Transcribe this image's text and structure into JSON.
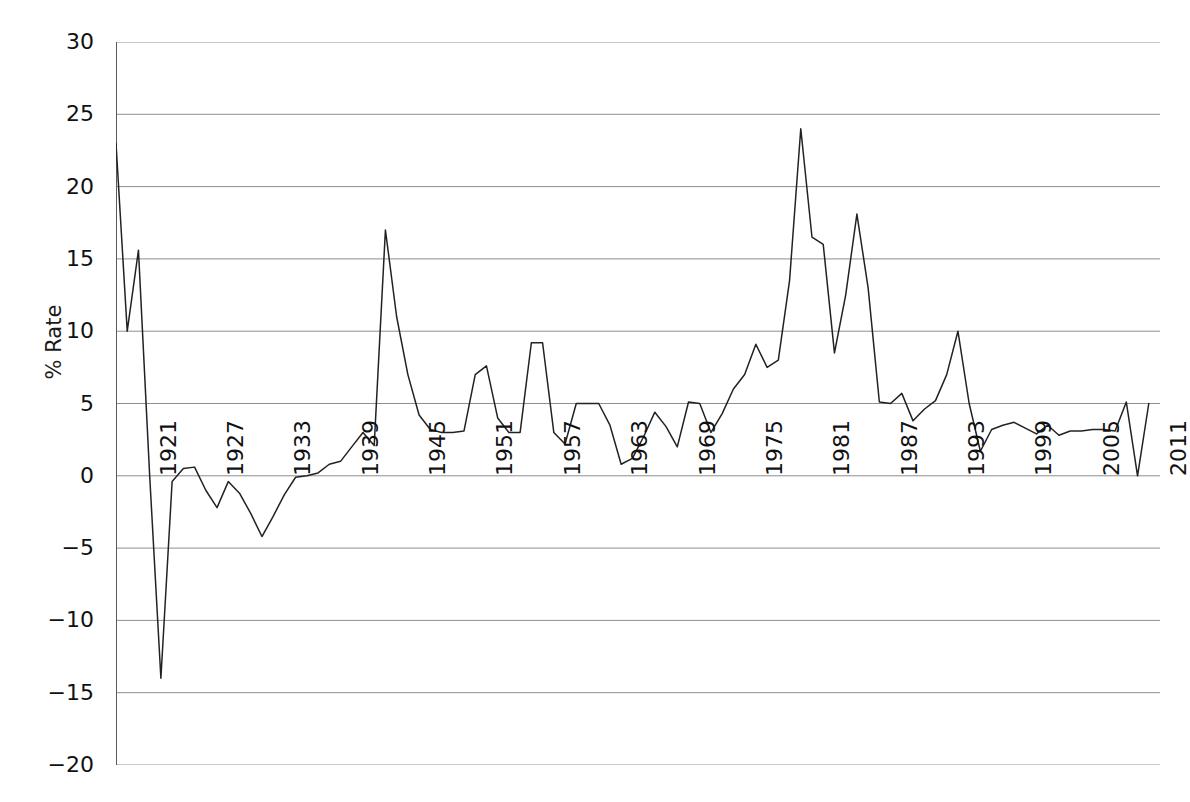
{
  "chart": {
    "title": "",
    "ylabel": "% Rate",
    "xlabel": ""
  },
  "chart_data": {
    "type": "line",
    "title": "",
    "subtitle": "",
    "xlabel": "",
    "ylabel": "% Rate",
    "grid": true,
    "legend": false,
    "legend_position": "none",
    "line_color": "#222222",
    "xlim": [
      1918,
      2011
    ],
    "ylim": [
      -20,
      30
    ],
    "yticks": [
      30,
      25,
      20,
      15,
      10,
      5,
      0,
      -5,
      -10,
      -15,
      -20
    ],
    "ytick_labels": [
      "30",
      "25",
      "20",
      "15",
      "10",
      "5",
      "0",
      "−5",
      "−10",
      "−15",
      "−20"
    ],
    "xticks": [
      1921,
      1927,
      1933,
      1939,
      1945,
      1951,
      1957,
      1963,
      1969,
      1975,
      1981,
      1987,
      1993,
      1999,
      2005,
      2011
    ],
    "xtick_labels": [
      "1921",
      "1927",
      "1933",
      "1939",
      "1945",
      "1951",
      "1957",
      "1963",
      "1969",
      "1975",
      "1981",
      "1987",
      "1993",
      "1999",
      "2005",
      "2011"
    ],
    "series": [
      {
        "name": "% Rate",
        "x": [
          1918,
          1919,
          1920,
          1921,
          1922,
          1923,
          1924,
          1925,
          1926,
          1927,
          1928,
          1929,
          1930,
          1931,
          1932,
          1933,
          1934,
          1935,
          1936,
          1937,
          1938,
          1939,
          1940,
          1941,
          1942,
          1943,
          1944,
          1945,
          1946,
          1947,
          1948,
          1949,
          1950,
          1951,
          1952,
          1953,
          1954,
          1955,
          1956,
          1957,
          1958,
          1959,
          1960,
          1961,
          1962,
          1963,
          1964,
          1965,
          1966,
          1967,
          1968,
          1969,
          1970,
          1971,
          1972,
          1973,
          1974,
          1975,
          1976,
          1977,
          1978,
          1979,
          1980,
          1981,
          1982,
          1983,
          1984,
          1985,
          1986,
          1987,
          1988,
          1989,
          1990,
          1991,
          1992,
          1993,
          1994,
          1995,
          1996,
          1997,
          1998,
          1999,
          2000,
          2001,
          2002,
          2003,
          2004,
          2005,
          2006,
          2007,
          2008,
          2009,
          2010
        ],
        "values": [
          23.0,
          10.0,
          15.6,
          0.0,
          -14.0,
          -0.4,
          0.5,
          0.6,
          -1.0,
          -2.2,
          -0.4,
          -1.2,
          -2.6,
          -4.2,
          -2.8,
          -1.3,
          -0.1,
          0.0,
          0.2,
          0.8,
          1.0,
          2.0,
          3.0,
          2.1,
          17.0,
          11.0,
          7.0,
          4.2,
          3.2,
          3.0,
          3.0,
          3.1,
          7.0,
          7.6,
          4.0,
          3.0,
          3.0,
          9.2,
          9.2,
          3.0,
          2.2,
          5.0,
          5.0,
          5.0,
          3.5,
          0.8,
          1.2,
          2.7,
          4.4,
          3.4,
          2.0,
          5.1,
          5.0,
          3.0,
          4.3,
          6.0,
          7.0,
          9.1,
          7.5,
          8.0,
          13.5,
          24.0,
          16.5,
          16.0,
          8.5,
          12.5,
          18.1,
          13.0,
          5.1,
          5.0,
          5.7,
          3.8,
          4.6,
          5.2,
          7.0,
          10.0,
          5.0,
          1.7,
          3.2,
          3.5,
          3.7,
          3.3,
          2.9,
          3.5,
          2.8,
          3.1,
          3.1,
          3.2,
          3.2,
          3.1,
          5.1,
          0.0,
          5.0
        ]
      }
    ]
  }
}
